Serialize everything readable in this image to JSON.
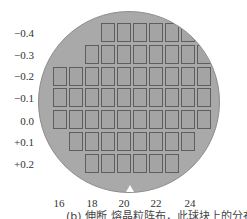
{
  "chart_data": {
    "type": "heatmap",
    "title": "",
    "caption": "(b) 伸断 熔晶粒阵布，此球块上的分布示意图",
    "xlabel": "",
    "ylabel": "",
    "x_ticks": [
      "16",
      "18",
      "20",
      "22",
      "24"
    ],
    "y_ticks": [
      "−0.4",
      "−0.3",
      "−0.2",
      "−0.1",
      "0.0",
      "+0.1",
      "+0.2"
    ],
    "grid": false,
    "rows": [
      {
        "y": "−0.4",
        "start_col": 3,
        "count": 6
      },
      {
        "y": "−0.3",
        "start_col": 2,
        "count": 8
      },
      {
        "y": "−0.2",
        "start_col": 0,
        "count": 10
      },
      {
        "y": "−0.1",
        "start_col": 0,
        "count": 10
      },
      {
        "y": "0.0",
        "start_col": 0,
        "count": 10
      },
      {
        "y": "+0.1",
        "start_col": 1,
        "count": 8
      },
      {
        "y": "+0.2",
        "start_col": 2,
        "count": 6
      }
    ],
    "total_dies": 58
  },
  "colors": {
    "wafer": "#a9a9a9",
    "die_border": "#5e5e5e",
    "die_fill": "#a4a4a4"
  }
}
